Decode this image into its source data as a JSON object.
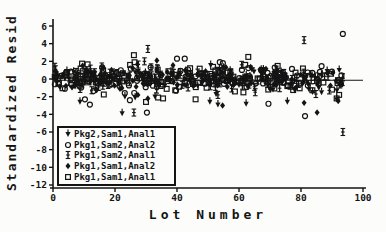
{
  "page": {
    "background": "#fcfcfa",
    "ink": "#141414"
  },
  "chart_data": {
    "type": "scatter",
    "title": "",
    "xlabel": "Lot Number",
    "ylabel": "Standardized Resid",
    "xlim": [
      0,
      100
    ],
    "ylim": [
      -12,
      6
    ],
    "xticks": [
      0,
      20,
      40,
      60,
      80,
      100
    ],
    "yticks": [
      6,
      4,
      2,
      0,
      -2,
      -4,
      -6,
      -8,
      -10,
      -12
    ],
    "grid": false,
    "legend_position": "inside-bottom-left",
    "reference_line": {
      "y": -0.15,
      "x_from": 0,
      "x_to": 100
    },
    "dense_band": {
      "comment": "heavily overplotted cloud of residuals around 0, all five series mixed",
      "x_min": 0.5,
      "x_max": 93.5,
      "y_center": 0,
      "y_halfwidth": 2.0,
      "count": 540,
      "seed": 7
    },
    "series": [
      {
        "label": "Pkg2,Sam1,Anal1",
        "marker": "triangle-down-stem",
        "outliers": [
          [
            8.7,
            -2.6
          ],
          [
            22.3,
            -3.9
          ],
          [
            23.2,
            -2.0
          ],
          [
            26.5,
            -2.1
          ],
          [
            32.9,
            -2.0
          ],
          [
            50.6,
            -2.6
          ],
          [
            53.2,
            -2.9
          ],
          [
            62.3,
            -2.8
          ],
          [
            75.6,
            -2.6
          ],
          [
            91.5,
            -2.3
          ]
        ]
      },
      {
        "label": "Pkg1,Sam2,Anal2",
        "marker": "circle-open",
        "outliers": [
          [
            10.3,
            -2.3
          ],
          [
            11.9,
            -2.9
          ],
          [
            24.8,
            -2.4
          ],
          [
            30.3,
            -3.8
          ],
          [
            40.0,
            2.3
          ],
          [
            42.5,
            2.3
          ],
          [
            53.8,
            1.9
          ],
          [
            54.8,
            1.8
          ],
          [
            69.5,
            -2.8
          ],
          [
            81.3,
            -4.2
          ],
          [
            93.5,
            5.1
          ]
        ]
      },
      {
        "label": "Pkg1,Sam2,Anal1",
        "marker": "ibeam",
        "outliers": [
          [
            0.8,
            1.1
          ],
          [
            26.1,
            -3.8
          ],
          [
            29.5,
            2.0
          ],
          [
            30.6,
            3.4
          ],
          [
            53.2,
            -1.8
          ],
          [
            81.0,
            4.4
          ],
          [
            84.8,
            -1.7
          ],
          [
            93.5,
            -6.0
          ]
        ]
      },
      {
        "label": "Pkg1,Sam1,Anal2",
        "marker": "diamond-filled",
        "outliers": [
          [
            27.4,
            -1.8
          ],
          [
            30.6,
            -2.2
          ],
          [
            33.5,
            2.1
          ],
          [
            54.7,
            -3.0
          ],
          [
            81.0,
            -2.7
          ],
          [
            85.2,
            -3.8
          ],
          [
            92.0,
            -2.5
          ]
        ]
      },
      {
        "label": "Pkg1,Sam1,Anal1",
        "marker": "square-open",
        "outliers": [
          [
            26.1,
            2.7
          ],
          [
            26.3,
            1.9
          ],
          [
            30.0,
            -2.6
          ],
          [
            33.9,
            -2.1
          ],
          [
            35.5,
            -2.2
          ],
          [
            46.0,
            -2.3
          ],
          [
            62.0,
            1.6
          ],
          [
            63.0,
            2.5
          ],
          [
            91.5,
            -2.2
          ],
          [
            92.3,
            -1.8
          ]
        ]
      }
    ]
  }
}
